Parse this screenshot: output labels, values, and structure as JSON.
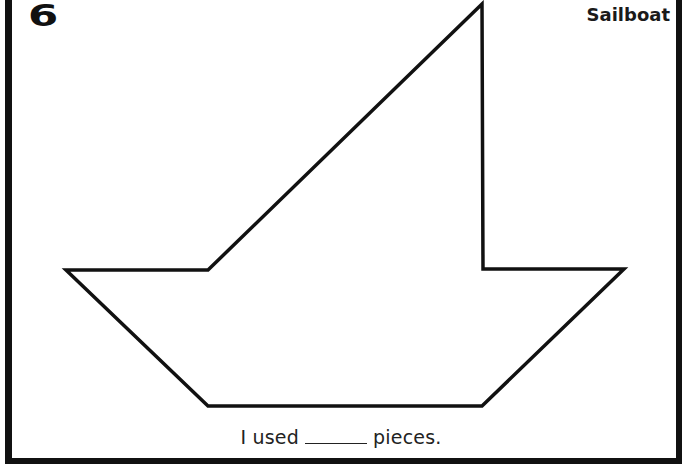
{
  "worksheet": {
    "number": "6",
    "title": "Sailboat",
    "caption": {
      "prefix": "I used",
      "blank": "_____",
      "suffix": "pieces."
    }
  },
  "shape": {
    "name": "sailboat-outline",
    "stroke_color": "#111111",
    "fill_color": "#ffffff",
    "points": "482,4 483,269 624,269 482,406 208,406 66,270 208,270"
  },
  "colors": {
    "frame": "#111111",
    "background": "#ffffff",
    "text": "#1a1a1a"
  }
}
